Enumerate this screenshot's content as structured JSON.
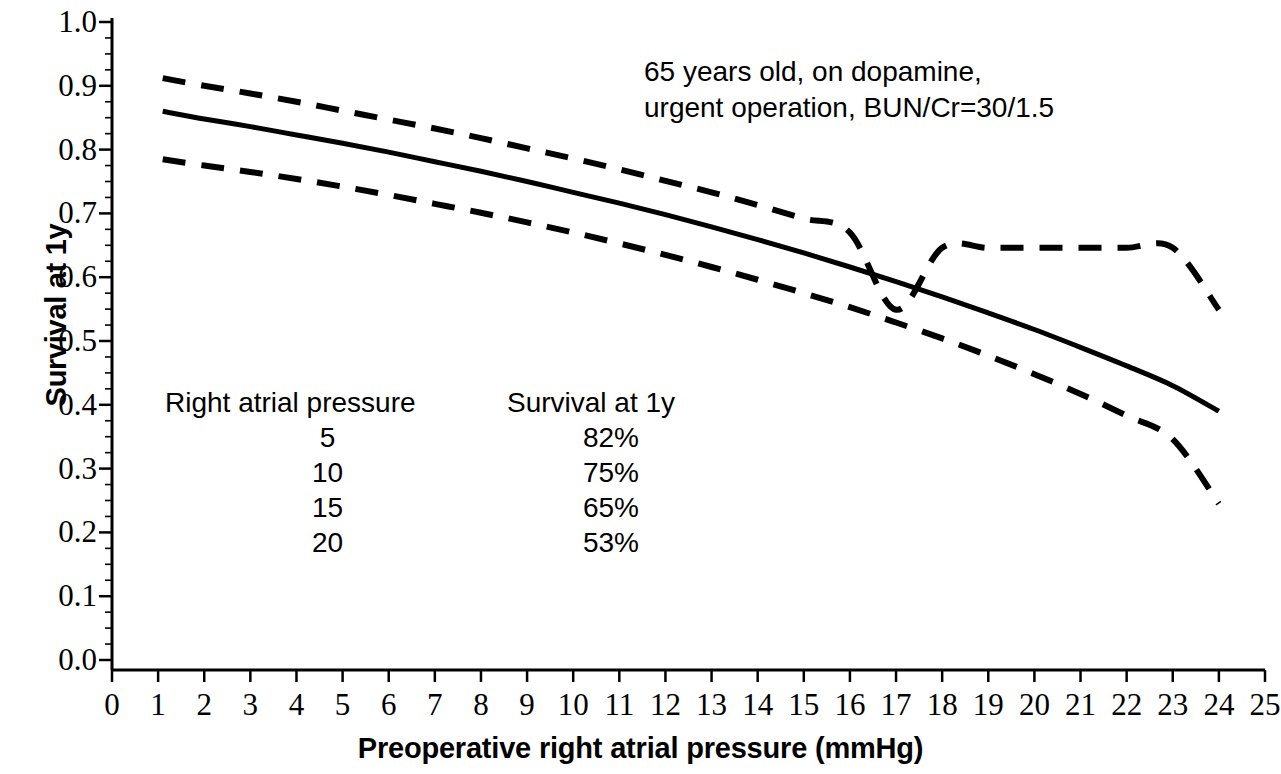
{
  "chart_data": {
    "type": "line",
    "title": "",
    "xlabel": "Preoperative right atrial pressure (mmHg)",
    "ylabel": "Survival at 1y",
    "xlim": [
      0,
      25
    ],
    "ylim": [
      0.0,
      1.0
    ],
    "grid": false,
    "legend": "none",
    "x_ticks": [
      "0",
      "1",
      "2",
      "3",
      "4",
      "5",
      "6",
      "7",
      "8",
      "9",
      "10",
      "11",
      "12",
      "13",
      "14",
      "15",
      "16",
      "17",
      "18",
      "19",
      "20",
      "21",
      "22",
      "23",
      "24",
      "25"
    ],
    "y_ticks": [
      "0.0",
      "0.1",
      "0.2",
      "0.3",
      "0.4",
      "0.5",
      "0.6",
      "0.7",
      "0.8",
      "0.9",
      "1.0"
    ],
    "x": [
      1.1,
      2,
      3,
      4,
      5,
      6,
      7,
      8,
      9,
      10,
      11,
      12,
      13,
      14,
      15,
      16,
      17,
      18,
      19,
      20,
      21,
      22,
      23,
      24
    ],
    "series": [
      {
        "name": "Upper 95% confidence limit",
        "style": "dashed",
        "color": "#000000",
        "values": [
          0.912,
          0.9,
          0.888,
          0.875,
          0.861,
          0.847,
          0.833,
          0.818,
          0.802,
          0.786,
          0.769,
          0.751,
          0.733,
          0.713,
          0.692,
          0.67,
          0.549,
          0.646,
          0.646,
          0.646,
          0.646,
          0.646,
          0.646,
          0.549
        ]
      },
      {
        "name": "Predicted survival",
        "style": "solid",
        "color": "#000000",
        "values": [
          0.86,
          0.848,
          0.836,
          0.823,
          0.81,
          0.796,
          0.781,
          0.766,
          0.75,
          0.733,
          0.716,
          0.698,
          0.679,
          0.659,
          0.638,
          0.616,
          0.593,
          0.569,
          0.544,
          0.518,
          0.49,
          0.461,
          0.43,
          0.39
        ]
      },
      {
        "name": "Lower 95% confidence limit",
        "style": "dashed",
        "color": "#000000",
        "values": [
          0.785,
          0.775,
          0.765,
          0.754,
          0.742,
          0.729,
          0.715,
          0.701,
          0.686,
          0.67,
          0.653,
          0.635,
          0.616,
          0.596,
          0.575,
          0.553,
          0.529,
          0.504,
          0.477,
          0.448,
          0.417,
          0.383,
          0.346,
          0.245
        ]
      }
    ],
    "annotations": [
      "65 years old, on dopamine,",
      "urgent operation, BUN/Cr=30/1.5"
    ],
    "inset_table": {
      "headers": [
        "Right atrial pressure",
        "Survival at 1y"
      ],
      "rows": [
        [
          "5",
          "82%"
        ],
        [
          "10",
          "75%"
        ],
        [
          "15",
          "65%"
        ],
        [
          "20",
          "53%"
        ]
      ]
    }
  },
  "axes": {
    "y_title": "Survival at 1y",
    "x_title": "Preoperative right atrial pressure (mmHg)",
    "y_tick_labels": [
      "1.0",
      "0.9",
      "0.8",
      "0.7",
      "0.6",
      "0.5",
      "0.4",
      "0.3",
      "0.2",
      "0.1",
      "0.0"
    ],
    "x_tick_labels": [
      "0",
      "1",
      "2",
      "3",
      "4",
      "5",
      "6",
      "7",
      "8",
      "9",
      "10",
      "11",
      "12",
      "13",
      "14",
      "15",
      "16",
      "17",
      "18",
      "19",
      "20",
      "21",
      "22",
      "23",
      "24",
      "25"
    ]
  },
  "annotation": {
    "line1": "65 years old, on dopamine,",
    "line2": "urgent operation, BUN/Cr=30/1.5"
  },
  "table": {
    "header_pressure": "Right atrial pressure",
    "header_survival": "Survival at 1y",
    "rows": [
      {
        "pressure": "5",
        "survival": "82%"
      },
      {
        "pressure": "10",
        "survival": "75%"
      },
      {
        "pressure": "15",
        "survival": "65%"
      },
      {
        "pressure": "20",
        "survival": "53%"
      }
    ]
  },
  "colors": {
    "line": "#000000",
    "background": "#ffffff",
    "axis": "#000000"
  }
}
